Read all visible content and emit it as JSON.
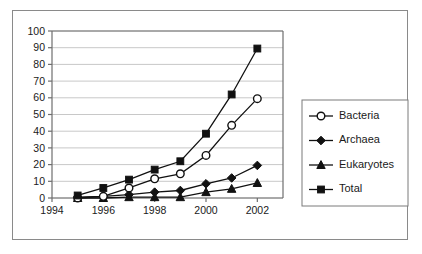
{
  "chart_data": {
    "type": "line",
    "title": "",
    "subtitle": "",
    "xlabel": "",
    "ylabel": "",
    "x": [
      1995,
      1996,
      1997,
      1998,
      1999,
      2000,
      2001,
      2002
    ],
    "xlim": [
      1994,
      2003
    ],
    "ylim": [
      0,
      100
    ],
    "xticks": [
      1994,
      1996,
      1998,
      2000,
      2002
    ],
    "xticklabels": [
      "1994",
      "1996",
      "1998",
      "2000",
      "2002"
    ],
    "yticks": [
      0,
      10,
      20,
      30,
      40,
      50,
      60,
      70,
      80,
      90,
      100
    ],
    "yticklabels": [
      "0",
      "10",
      "20",
      "30",
      "40",
      "50",
      "60",
      "70",
      "80",
      "90",
      "100"
    ],
    "grid": "horizontal",
    "legend_position": "right-outside",
    "series": [
      {
        "name": "Bacteria",
        "marker": "open-circle",
        "color": "#111111",
        "values": [
          0,
          1,
          6,
          11.5,
          14.5,
          25.5,
          43.5,
          59.5
        ]
      },
      {
        "name": "Archaea",
        "marker": "filled-diamond",
        "color": "#111111",
        "values": [
          0.5,
          1,
          2,
          3.5,
          4.5,
          8.5,
          12,
          19.5
        ]
      },
      {
        "name": "Eukaryotes",
        "marker": "filled-triangle",
        "color": "#111111",
        "values": [
          0,
          0,
          0.5,
          0.5,
          0.5,
          3.5,
          5.5,
          9
        ]
      },
      {
        "name": "Total",
        "marker": "filled-square",
        "color": "#111111",
        "values": [
          1.5,
          6,
          11,
          17,
          22,
          38.5,
          62,
          89.5
        ]
      }
    ]
  },
  "legend": {
    "items": [
      {
        "label": "Bacteria",
        "marker": "open-circle"
      },
      {
        "label": "Archaea",
        "marker": "filled-diamond"
      },
      {
        "label": "Eukaryotes",
        "marker": "filled-triangle"
      },
      {
        "label": "Total",
        "marker": "filled-square"
      }
    ]
  },
  "colors": {
    "ink": "#111111",
    "grid": "#c8c8c8",
    "axis": "#6e6e6e",
    "frame": "#8a8a8a",
    "background": "#ffffff"
  }
}
